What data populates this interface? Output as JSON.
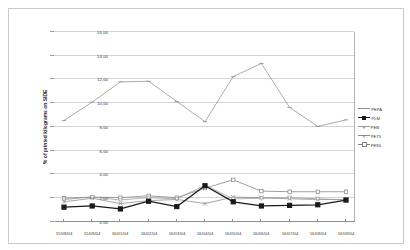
{
  "chart_data": {
    "type": "line",
    "title": "",
    "subtitle": "",
    "xlabel": "",
    "ylabel": "% of printed kilograms on SIDE",
    "ylim": [
      0.0,
      16.0
    ],
    "ytick_labels": [
      "0,00",
      "2,00",
      "4,00",
      "6,00",
      "8,00",
      "10,00",
      "12,00",
      "14,00",
      "16,00"
    ],
    "ytick_values": [
      0.0,
      2.0,
      4.0,
      6.0,
      8.0,
      10.0,
      12.0,
      14.0,
      16.0
    ],
    "y_inverted": true,
    "grid": true,
    "legend_position": "left",
    "categories": [
      "16/09/04",
      "16/08/04",
      "16/07/04",
      "16/06/04",
      "16/05/04",
      "16/04/04",
      "16/03/04",
      "16/02/04",
      "16/01/04",
      "15/09/04",
      "15/08/04"
    ],
    "series": [
      {
        "name": "PE90",
        "color": "#808080",
        "marker": "square",
        "values": [
          2.55,
          2.55,
          2.55,
          2.6,
          3.55,
          2.85,
          2.05,
          2.2,
          2.05,
          2.1,
          2.0
        ]
      },
      {
        "name": "PE75",
        "color": "#8a8a8a",
        "marker": "cross",
        "values": [
          1.9,
          1.9,
          1.95,
          2.05,
          2.1,
          1.55,
          1.9,
          1.8,
          1.55,
          2.0,
          1.7
        ]
      },
      {
        "name": "PEB",
        "color": "#9a9a9a",
        "marker": "triangle",
        "values": [
          1.85,
          1.95,
          2.05,
          2.0,
          1.95,
          3.1,
          1.95,
          2.05,
          1.85,
          2.1,
          1.9
        ]
      },
      {
        "name": "PLM",
        "color": "#1a1a1a",
        "marker": "square-filled",
        "values": [
          1.85,
          1.45,
          1.4,
          1.35,
          1.7,
          3.05,
          1.3,
          1.75,
          1.1,
          1.35,
          1.25
        ]
      },
      {
        "name": "PEPA",
        "color": "#8f8f8f",
        "marker": "dash",
        "values": [
          8.6,
          8.05,
          9.65,
          13.35,
          12.25,
          8.45,
          10.15,
          11.85,
          11.8,
          10.1,
          8.55
        ]
      }
    ]
  }
}
